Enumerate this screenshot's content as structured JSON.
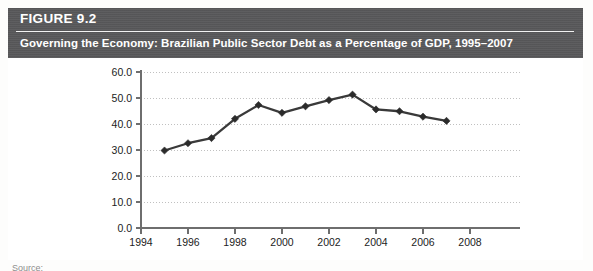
{
  "figure": {
    "number_label": "FIGURE 9.2",
    "title": "Governing the Economy: Brazilian Public Sector Debt as a Percentage of GDP, 1995–2007",
    "header_color": "#58585a",
    "source_note": "Source:"
  },
  "chart_data": {
    "type": "line",
    "title": "Governing the Economy: Brazilian Public Sector Debt as a Percentage of GDP, 1995–2007",
    "xlabel": "",
    "ylabel": "",
    "x": [
      1995,
      1996,
      1997,
      1998,
      1999,
      2000,
      2001,
      2002,
      2003,
      2004,
      2005,
      2006,
      2007
    ],
    "values": [
      29.8,
      32.6,
      34.6,
      42.0,
      47.3,
      44.3,
      46.8,
      49.2,
      51.3,
      45.6,
      44.9,
      42.8,
      41.2
    ],
    "series": [
      {
        "name": "Public Sector Debt (% of GDP)",
        "values": [
          29.8,
          32.6,
          34.6,
          42.0,
          47.3,
          44.3,
          46.8,
          49.2,
          51.3,
          45.6,
          44.9,
          42.8,
          41.2
        ]
      }
    ],
    "xlim": [
      1994,
      2008
    ],
    "ylim": [
      0.0,
      60.0
    ],
    "y_ticks": [
      0.0,
      10.0,
      20.0,
      30.0,
      40.0,
      50.0,
      60.0
    ],
    "y_tick_labels": [
      "0.0",
      "10.0",
      "20.0",
      "30.0",
      "40.0",
      "50.0",
      "60.0"
    ],
    "x_ticks": [
      1994,
      1996,
      1998,
      2000,
      2002,
      2004,
      2006,
      2008
    ],
    "x_tick_labels": [
      "1994",
      "1996",
      "1998",
      "2000",
      "2002",
      "2004",
      "2006",
      "2008"
    ],
    "grid": true,
    "grid_axis": "y",
    "legend": false,
    "legend_position": "none",
    "marker": "diamond",
    "line_color": "#3a3a3a",
    "marker_color": "#2b2b2b",
    "grid_color": "#b9b9b9"
  }
}
